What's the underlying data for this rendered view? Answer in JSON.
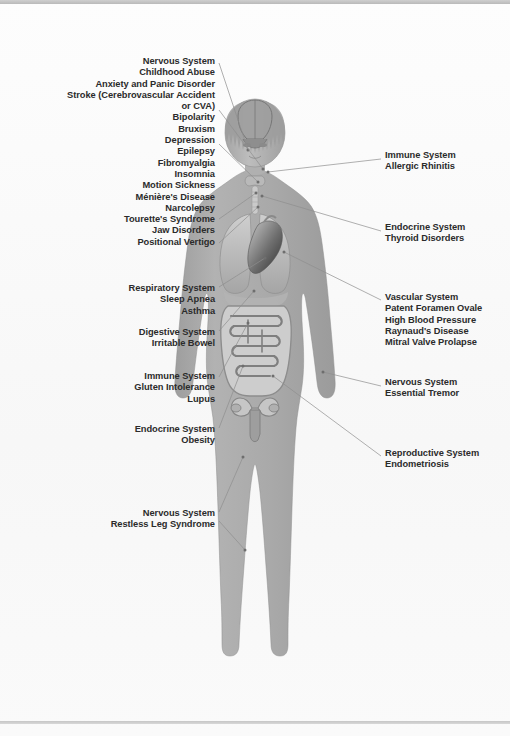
{
  "document": {
    "type": "anatomical-diagram",
    "subject": "Human body systems and associated disorders",
    "figure_name": "human-body-anatomy-figure"
  },
  "colors": {
    "background": "#fbfbfb",
    "body_fill": "#a9a9a9",
    "body_shade": "#9a9a9a",
    "body_highlight": "#c4c4c4",
    "organ_light": "#d6d6d6",
    "organ_mid": "#9d9d9d",
    "organ_dark": "#4a4a4a",
    "leader_line": "#8e8e8e",
    "text": "#2b2b2b",
    "rule_bar": "#c4c4c4"
  },
  "labels_left": [
    {
      "id": "nervous-system-head",
      "name": "label-nervous-system-head",
      "x": 8,
      "y": 56,
      "width": 207,
      "text": "Nervous System\nChildhood Abuse\nAnxiety and Panic Disorder\nStroke (Cerebrovascular Accident\nor CVA)\nBipolarity\nBruxism\nDepression\nEpilepsy\nFibromyalgia\nInsomnia\nMotion Sickness\nMénière's Disease\nNarcolepsy\nTourette's Syndrome\nJaw Disorders\nPositional Vertigo",
      "system": "Nervous System",
      "conditions": [
        "Childhood Abuse",
        "Anxiety and Panic Disorder",
        "Stroke (Cerebrovascular Accident or CVA)",
        "Bipolarity",
        "Bruxism",
        "Depression",
        "Epilepsy",
        "Fibromyalgia",
        "Insomnia",
        "Motion Sickness",
        "Ménière's Disease",
        "Narcolepsy",
        "Tourette's Syndrome",
        "Jaw Disorders",
        "Positional Vertigo"
      ]
    },
    {
      "id": "respiratory-system",
      "name": "label-respiratory-system",
      "x": 8,
      "y": 283,
      "width": 207,
      "text": "Respiratory System\nSleep Apnea\nAsthma",
      "system": "Respiratory System",
      "conditions": [
        "Sleep Apnea",
        "Asthma"
      ]
    },
    {
      "id": "digestive-system",
      "name": "label-digestive-system",
      "x": 8,
      "y": 327,
      "width": 207,
      "text": "Digestive System\nIrritable Bowel",
      "system": "Digestive System",
      "conditions": [
        "Irritable Bowel"
      ]
    },
    {
      "id": "immune-system-gut",
      "name": "label-immune-system-gut",
      "x": 8,
      "y": 371,
      "width": 207,
      "text": "Immune System\nGluten Intolerance\nLupus",
      "system": "Immune System",
      "conditions": [
        "Gluten Intolerance",
        "Lupus"
      ]
    },
    {
      "id": "endocrine-system-obesity",
      "name": "label-endocrine-system-obesity",
      "x": 8,
      "y": 424,
      "width": 207,
      "text": "Endocrine System\nObesity",
      "system": "Endocrine System",
      "conditions": [
        "Obesity"
      ]
    },
    {
      "id": "nervous-system-legs",
      "name": "label-nervous-system-legs",
      "x": 8,
      "y": 508,
      "width": 207,
      "text": "Nervous System\nRestless Leg Syndrome",
      "system": "Nervous System",
      "conditions": [
        "Restless Leg Syndrome"
      ]
    }
  ],
  "labels_right": [
    {
      "id": "immune-system-rhinitis",
      "name": "label-immune-system-rhinitis",
      "x": 385,
      "y": 150,
      "width": 120,
      "text": "Immune System\nAllergic Rhinitis",
      "system": "Immune System",
      "conditions": [
        "Allergic Rhinitis"
      ]
    },
    {
      "id": "endocrine-system-thyroid",
      "name": "label-endocrine-system-thyroid",
      "x": 385,
      "y": 222,
      "width": 120,
      "text": "Endocrine System\nThyroid Disorders",
      "system": "Endocrine System",
      "conditions": [
        "Thyroid Disorders"
      ]
    },
    {
      "id": "vascular-system",
      "name": "label-vascular-system",
      "x": 385,
      "y": 292,
      "width": 120,
      "text": "Vascular System\nPatent Foramen Ovale\nHigh Blood Pressure\nRaynaud's Disease\nMitral Valve Prolapse",
      "system": "Vascular System",
      "conditions": [
        "Patent Foramen Ovale",
        "High Blood Pressure",
        "Raynaud's Disease",
        "Mitral Valve Prolapse"
      ]
    },
    {
      "id": "nervous-system-tremor",
      "name": "label-nervous-system-tremor",
      "x": 385,
      "y": 377,
      "width": 120,
      "text": "Nervous System\nEssential Tremor",
      "system": "Nervous System",
      "conditions": [
        "Essential Tremor"
      ]
    },
    {
      "id": "reproductive-system",
      "name": "label-reproductive-system",
      "x": 385,
      "y": 448,
      "width": 120,
      "text": "Reproductive System\nEndometriosis",
      "system": "Reproductive System",
      "conditions": [
        "Endometriosis"
      ]
    }
  ],
  "leader_lines": [
    {
      "name": "leader-nervous-head-1",
      "x1": 219,
      "y1": 63,
      "x2": 248,
      "y2": 150
    },
    {
      "name": "leader-nervous-head-2",
      "x1": 219,
      "y1": 110,
      "x2": 263,
      "y2": 169
    },
    {
      "name": "leader-nervous-head-3",
      "x1": 219,
      "y1": 144,
      "x2": 258,
      "y2": 182
    },
    {
      "name": "leader-nervous-head-4",
      "x1": 219,
      "y1": 219,
      "x2": 256,
      "y2": 193
    },
    {
      "name": "leader-nervous-head-5",
      "x1": 219,
      "y1": 243,
      "x2": 258,
      "y2": 207
    },
    {
      "name": "leader-respiratory",
      "x1": 219,
      "y1": 287,
      "x2": 265,
      "y2": 258
    },
    {
      "name": "leader-digestive",
      "x1": 219,
      "y1": 331,
      "x2": 254,
      "y2": 291
    },
    {
      "name": "leader-immune-gut",
      "x1": 219,
      "y1": 377,
      "x2": 248,
      "y2": 323
    },
    {
      "name": "leader-endocrine-obesity",
      "x1": 219,
      "y1": 428,
      "x2": 243,
      "y2": 366
    },
    {
      "name": "leader-nervous-legs-1",
      "x1": 219,
      "y1": 512,
      "x2": 243,
      "y2": 457
    },
    {
      "name": "leader-nervous-legs-2",
      "x1": 219,
      "y1": 521,
      "x2": 245,
      "y2": 550
    },
    {
      "name": "leader-immune-rhinitis",
      "x1": 381,
      "y1": 159,
      "x2": 268,
      "y2": 172
    },
    {
      "name": "leader-endocrine-thyroid",
      "x1": 381,
      "y1": 231,
      "x2": 262,
      "y2": 196
    },
    {
      "name": "leader-vascular",
      "x1": 381,
      "y1": 300,
      "x2": 284,
      "y2": 252
    },
    {
      "name": "leader-nervous-tremor",
      "x1": 381,
      "y1": 386,
      "x2": 323,
      "y2": 372
    },
    {
      "name": "leader-reproductive",
      "x1": 381,
      "y1": 456,
      "x2": 273,
      "y2": 376
    }
  ]
}
